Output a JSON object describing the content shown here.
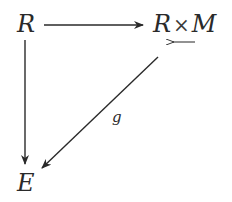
{
  "diagram": {
    "type": "commutative-diagram",
    "nodes": {
      "top_left": "R",
      "top_right_left": "R",
      "top_right_op": "×",
      "top_right_right": "M",
      "bottom_left": "E"
    },
    "labels": {
      "diagonal": "g"
    },
    "edges": [
      {
        "from": "R",
        "to": "R×M",
        "direction": "right",
        "label": ""
      },
      {
        "from": "R",
        "to": "E",
        "direction": "down",
        "label": ""
      },
      {
        "from": "R×M",
        "to": "E",
        "direction": "down-left",
        "label": "g"
      }
    ],
    "annotations": [
      {
        "near": "R×M",
        "symbol": "leftward-arrow",
        "description": "small left arrow beneath ×M"
      }
    ],
    "colors": {
      "ink": "#2a2a2a",
      "background": "#ffffff"
    }
  }
}
